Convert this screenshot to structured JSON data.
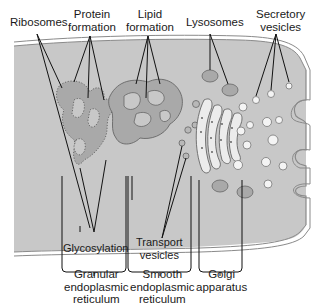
{
  "figure": {
    "type": "cell-endomembrane-diagram",
    "colors": {
      "cytoplasm": "#c8c8c8",
      "membrane": "#8a8a8a",
      "organelle_fill": "#a9a9a9",
      "vesicle_fill": "#f4f4f4",
      "lines": "#111111",
      "text": "#1a1a1a"
    }
  },
  "labels": {
    "top": [
      {
        "id": "ribosomes",
        "text": "Ribosomes"
      },
      {
        "id": "protein-formation",
        "text": "Protein\nformation"
      },
      {
        "id": "lipid-formation",
        "text": "Lipid\nformation"
      },
      {
        "id": "lysosomes",
        "text": "Lysosomes"
      },
      {
        "id": "secretory-vesicles",
        "text": "Secretory\nvesicles"
      }
    ],
    "inner": [
      {
        "id": "glycosylation",
        "text": "Glycosylation"
      },
      {
        "id": "transport-vesicles",
        "text": "Transport\nvesicles"
      }
    ],
    "bottom": [
      {
        "id": "granular-er",
        "text": "Granular\nendoplasmic\nreticulum"
      },
      {
        "id": "smooth-er",
        "text": "Smooth\nendoplasmic\nreticulum"
      },
      {
        "id": "golgi",
        "text": "Golgi\napparatus"
      }
    ]
  }
}
